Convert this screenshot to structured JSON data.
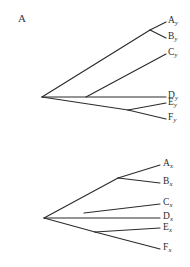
{
  "figure": {
    "panel_label": "A",
    "background_color": "#ffffff",
    "line_color": "#2b2b2b",
    "text_color": "#2b2b2b"
  },
  "diagram_type": "phylogenetic-cladogram-pair",
  "trees": [
    {
      "id": "tree-y",
      "taxon_suffix": "y",
      "tips": [
        {
          "base": "A",
          "sub": "y",
          "label": "Ay"
        },
        {
          "base": "B",
          "sub": "y",
          "label": "By"
        },
        {
          "base": "C",
          "sub": "y",
          "label": "Cy"
        },
        {
          "base": "D",
          "sub": "y",
          "label": "Dy"
        },
        {
          "base": "E",
          "sub": "y",
          "label": "Ey"
        },
        {
          "base": "F",
          "sub": "y",
          "label": "Fy"
        }
      ]
    },
    {
      "id": "tree-x",
      "taxon_suffix": "x",
      "tips": [
        {
          "base": "A",
          "sub": "x",
          "label": "Ax"
        },
        {
          "base": "B",
          "sub": "x",
          "label": "Bx"
        },
        {
          "base": "C",
          "sub": "x",
          "label": "Cx"
        },
        {
          "base": "D",
          "sub": "x",
          "label": "Dx"
        },
        {
          "base": "E",
          "sub": "x",
          "label": "Ex"
        },
        {
          "base": "F",
          "sub": "x",
          "label": "Fx"
        }
      ]
    }
  ]
}
